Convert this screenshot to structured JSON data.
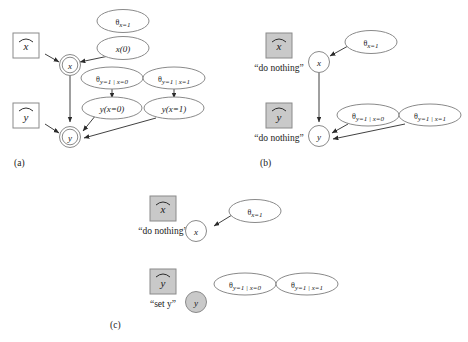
{
  "figure": {
    "panels": [
      {
        "id": "a",
        "label": "(a)",
        "decision_nodes": [
          {
            "name": "x-hat",
            "glyph": "x",
            "filled": false
          },
          {
            "name": "y-hat",
            "glyph": "y",
            "filled": false
          }
        ],
        "chance_nodes": [
          {
            "name": "x",
            "glyph": "x",
            "double": true,
            "filled": false
          },
          {
            "name": "y",
            "glyph": "y",
            "double": true,
            "filled": false
          }
        ],
        "parameter_nodes": [
          {
            "name": "theta-x",
            "theta": "θ",
            "sub": "x=1"
          },
          {
            "name": "x-prior",
            "text": "x(0)"
          },
          {
            "name": "theta-y-given-x0",
            "theta": "θ",
            "sub": "y=1 | x=0"
          },
          {
            "name": "theta-y-given-x1",
            "theta": "θ",
            "sub": "y=1 | x=1"
          },
          {
            "name": "y-x0",
            "text": "y(x=0)"
          },
          {
            "name": "y-x1",
            "text": "y(x=1)"
          }
        ]
      },
      {
        "id": "b",
        "label": "(b)",
        "decision_nodes": [
          {
            "name": "x-hat",
            "glyph": "x",
            "filled": true,
            "annotation": "“do nothing”"
          },
          {
            "name": "y-hat",
            "glyph": "y",
            "filled": true,
            "annotation": "“do nothing”"
          }
        ],
        "chance_nodes": [
          {
            "name": "x",
            "glyph": "x",
            "double": false,
            "filled": false
          },
          {
            "name": "y",
            "glyph": "y",
            "double": false,
            "filled": false
          }
        ],
        "parameter_nodes": [
          {
            "name": "theta-x",
            "theta": "θ",
            "sub": "x=1"
          },
          {
            "name": "theta-y-given-x0",
            "theta": "θ",
            "sub": "y=1 | x=0"
          },
          {
            "name": "theta-y-given-x1",
            "theta": "θ",
            "sub": "y=1 | x=1"
          }
        ]
      },
      {
        "id": "c",
        "label": "(c)",
        "decision_nodes": [
          {
            "name": "x-hat",
            "glyph": "x",
            "filled": true,
            "annotation": "“do nothing”"
          },
          {
            "name": "y-hat",
            "glyph": "y",
            "filled": true,
            "annotation": "“set y”"
          }
        ],
        "chance_nodes": [
          {
            "name": "x",
            "glyph": "x",
            "double": false,
            "filled": false
          },
          {
            "name": "y",
            "glyph": "y",
            "double": false,
            "filled": true
          }
        ],
        "parameter_nodes": [
          {
            "name": "theta-x",
            "theta": "θ",
            "sub": "x=1"
          },
          {
            "name": "theta-y-given-x0",
            "theta": "θ",
            "sub": "y=1 | x=0"
          },
          {
            "name": "theta-y-given-x1",
            "theta": "θ",
            "sub": "y=1 | x=1"
          }
        ]
      }
    ],
    "colors": {
      "stroke": "#7a7a7a",
      "fill_gray": "#c9c9c9",
      "text": "#1a1a1a",
      "background": "#ffffff"
    }
  }
}
